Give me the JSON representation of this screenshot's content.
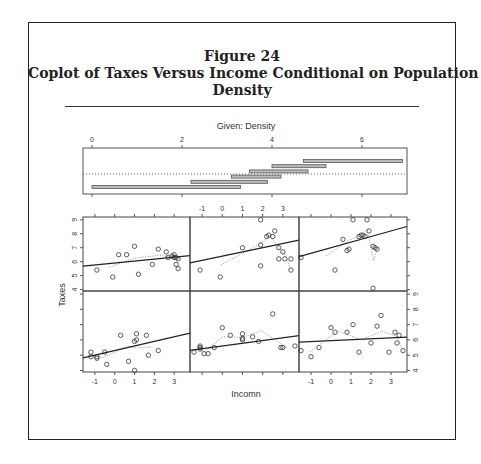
{
  "figure": {
    "label": "Figure 24",
    "title_line1": "Coplot of Taxes Versus Income Conditional on Population",
    "title_line2": "Density"
  },
  "chart_data": {
    "type": "scatter",
    "subtype": "coplot",
    "title": "Coplot of Taxes Versus Income Conditional on Population Density",
    "given_panel": {
      "label": "Given: Density",
      "axis_ticks": [
        0,
        2,
        4,
        6
      ],
      "xlim": [
        -0.2,
        7.0
      ],
      "intervals": [
        [
          0.0,
          3.3
        ],
        [
          2.2,
          3.9
        ],
        [
          3.1,
          4.2
        ],
        [
          3.5,
          4.8
        ],
        [
          4.0,
          5.2
        ],
        [
          4.7,
          6.9
        ]
      ],
      "dotted_reference": true
    },
    "xlabel": "Incomn",
    "ylabel": "Taxes",
    "x_ticks": [
      -1,
      0,
      1,
      2,
      3
    ],
    "y_ticks": [
      4,
      5,
      6,
      7,
      8,
      9
    ],
    "xlim": [
      -1.6,
      3.8
    ],
    "ylim": [
      3.9,
      9.2
    ],
    "panel_order": "bottom-left to top-right",
    "panels": [
      {
        "row": "bottom",
        "col": 1,
        "points": [
          [
            -1.2,
            5.2
          ],
          [
            -1.2,
            4.9
          ],
          [
            -0.9,
            4.8
          ],
          [
            -0.9,
            4.9
          ],
          [
            -0.5,
            5.2
          ],
          [
            -0.4,
            4.4
          ],
          [
            0.3,
            6.3
          ],
          [
            0.7,
            4.6
          ],
          [
            1.0,
            5.9
          ],
          [
            1.1,
            6.0
          ],
          [
            1.1,
            6.4
          ],
          [
            1.6,
            6.3
          ],
          [
            1.7,
            5.0
          ],
          [
            2.2,
            5.3
          ],
          [
            1.0,
            4.0
          ]
        ],
        "fit": {
          "intercept": 5.3,
          "slope": 0.3
        }
      },
      {
        "row": "bottom",
        "col": 2,
        "points": [
          [
            -1.4,
            5.2
          ],
          [
            -1.1,
            5.6
          ],
          [
            -1.1,
            5.5
          ],
          [
            -1.1,
            5.4
          ],
          [
            -0.9,
            5.1
          ],
          [
            -0.7,
            5.1
          ],
          [
            -0.4,
            5.5
          ],
          [
            0.0,
            6.8
          ],
          [
            0.4,
            6.3
          ],
          [
            1.0,
            6.1
          ],
          [
            1.0,
            6.0
          ],
          [
            1.0,
            6.4
          ],
          [
            1.5,
            6.2
          ],
          [
            1.8,
            5.9
          ],
          [
            2.5,
            7.7
          ],
          [
            2.9,
            5.5
          ],
          [
            3.6,
            5.6
          ],
          [
            3.0,
            5.5
          ]
        ],
        "fit": {
          "intercept": 5.6,
          "slope": 0.18
        }
      },
      {
        "row": "bottom",
        "col": 3,
        "points": [
          [
            -1.5,
            5.3
          ],
          [
            -1.0,
            4.9
          ],
          [
            -0.6,
            5.5
          ],
          [
            0.0,
            6.8
          ],
          [
            0.2,
            6.5
          ],
          [
            0.8,
            6.5
          ],
          [
            1.1,
            7.0
          ],
          [
            1.4,
            5.2
          ],
          [
            2.0,
            5.8
          ],
          [
            2.3,
            6.9
          ],
          [
            2.5,
            7.6
          ],
          [
            2.9,
            5.2
          ],
          [
            3.2,
            6.5
          ],
          [
            3.3,
            5.8
          ],
          [
            3.4,
            6.3
          ],
          [
            3.6,
            5.3
          ]
        ],
        "fit": {
          "intercept": 5.95,
          "slope": 0.06
        }
      },
      {
        "row": "top",
        "col": 1,
        "points": [
          [
            -0.9,
            5.4
          ],
          [
            -0.1,
            4.9
          ],
          [
            0.2,
            6.5
          ],
          [
            0.6,
            6.5
          ],
          [
            1.0,
            7.1
          ],
          [
            1.2,
            5.1
          ],
          [
            1.9,
            5.8
          ],
          [
            2.2,
            6.9
          ],
          [
            2.6,
            6.7
          ],
          [
            2.7,
            6.3
          ],
          [
            2.9,
            6.4
          ],
          [
            3.0,
            6.3
          ],
          [
            3.0,
            6.5
          ],
          [
            3.1,
            6.3
          ],
          [
            3.1,
            5.8
          ],
          [
            3.2,
            5.5
          ],
          [
            3.2,
            6.2
          ]
        ],
        "fit": {
          "intercept": 5.9,
          "slope": 0.14
        }
      },
      {
        "row": "top",
        "col": 2,
        "points": [
          [
            -1.1,
            5.4
          ],
          [
            -0.1,
            4.9
          ],
          [
            1.0,
            7.0
          ],
          [
            1.9,
            7.2
          ],
          [
            1.9,
            5.7
          ],
          [
            2.2,
            7.8
          ],
          [
            2.3,
            7.9
          ],
          [
            2.5,
            7.8
          ],
          [
            2.6,
            8.2
          ],
          [
            2.8,
            7.0
          ],
          [
            2.8,
            6.2
          ],
          [
            3.0,
            6.7
          ],
          [
            3.1,
            6.2
          ],
          [
            3.4,
            6.2
          ],
          [
            3.4,
            5.4
          ],
          [
            1.9,
            9.0
          ]
        ],
        "fit": {
          "intercept": 6.4,
          "slope": 0.3
        }
      },
      {
        "row": "top",
        "col": 3,
        "points": [
          [
            -1.5,
            6.3
          ],
          [
            0.6,
            7.6
          ],
          [
            0.2,
            5.4
          ],
          [
            0.8,
            6.8
          ],
          [
            0.9,
            6.9
          ],
          [
            1.4,
            7.8
          ],
          [
            1.5,
            7.9
          ],
          [
            1.6,
            7.9
          ],
          [
            1.7,
            7.8
          ],
          [
            1.9,
            8.2
          ],
          [
            2.1,
            7.1
          ],
          [
            2.2,
            7.0
          ],
          [
            2.3,
            6.9
          ],
          [
            2.1,
            4.1
          ],
          [
            1.1,
            9.0
          ],
          [
            1.8,
            9.0
          ]
        ],
        "fit": {
          "intercept": 7.0,
          "slope": 0.4
        }
      }
    ],
    "grid": false,
    "legend": "none"
  }
}
